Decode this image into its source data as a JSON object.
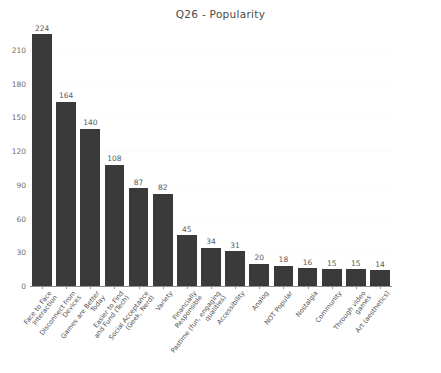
{
  "chart_data": {
    "type": "bar",
    "title": "Q26 - Popularity",
    "xlabel": "",
    "ylabel": "",
    "ylim": [
      0,
      224
    ],
    "yticks": [
      0,
      30,
      60,
      90,
      120,
      150,
      180,
      210
    ],
    "grid": true,
    "legend": null,
    "bar_color": "#3a3a3a",
    "value_labels_shown": true,
    "categories": [
      "Face to Face Interaction",
      "Disconnect from Devices",
      "Games are Better Today",
      "Easier to Find and Fund (Tech)",
      "Social Acceptance (Geek, Nerd)",
      "Variety",
      "Financially Responsible",
      "Pastime (fun, engaging qualities)",
      "Accessibility",
      "Analog",
      "NOT Popular",
      "Nostalgia",
      "Community",
      "Through video games",
      "Art (aesthetics)"
    ],
    "values": [
      224,
      164,
      140,
      108,
      87,
      82,
      45,
      34,
      31,
      20,
      18,
      16,
      15,
      15,
      14
    ]
  }
}
